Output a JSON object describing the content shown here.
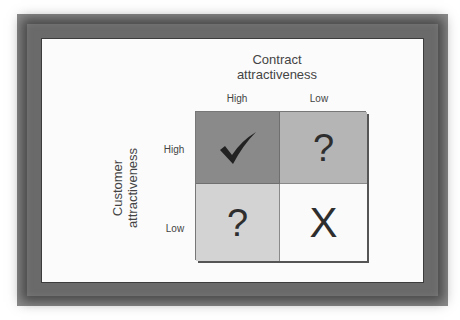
{
  "diagram": {
    "column_axis_title": "Contract attractiveness",
    "column_axis_title_lines": [
      "Contract",
      "attractiveness"
    ],
    "row_axis_title_lines": [
      "Customer",
      "attractiveness"
    ],
    "columns": [
      "High",
      "Low"
    ],
    "rows": [
      "High",
      "Low"
    ],
    "cells": [
      {
        "row": "High",
        "col": "High",
        "symbol": "✓",
        "icon": "checkmark-icon",
        "fill": "#8a8a8a"
      },
      {
        "row": "High",
        "col": "Low",
        "symbol": "?",
        "icon": "question-mark",
        "fill": "#b5b5b5"
      },
      {
        "row": "Low",
        "col": "High",
        "symbol": "?",
        "icon": "question-mark",
        "fill": "#d3d3d3"
      },
      {
        "row": "Low",
        "col": "Low",
        "symbol": "X",
        "icon": "x-mark",
        "fill": "#fafafa"
      }
    ]
  },
  "colors": {
    "frame": "#6a6a6a",
    "panel": "#fbfbfb",
    "text": "#444444",
    "glyph": "#2e2e2e"
  }
}
